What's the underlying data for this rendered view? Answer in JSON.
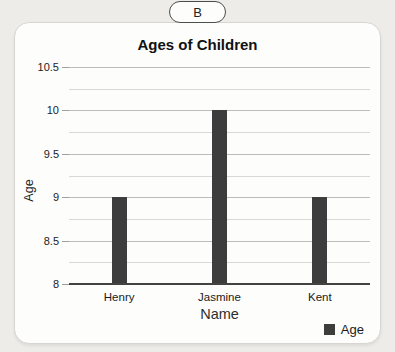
{
  "tab": {
    "label": "B"
  },
  "colors": {
    "bar": "#3d3d3d",
    "page_background": "#edece9",
    "card_background": "#fdfdfc",
    "gridline_major": "#bcbcbc",
    "gridline_minor": "#d8d8d8",
    "axis_baseline": "#434343"
  },
  "chart_data": {
    "type": "bar",
    "title": "Ages of Children",
    "xlabel": "Name",
    "ylabel": "Age",
    "categories": [
      "Henry",
      "Jasmine",
      "Kent"
    ],
    "series": [
      {
        "name": "Age",
        "values": [
          9,
          10,
          9
        ]
      }
    ],
    "ylim": [
      8,
      10.5
    ],
    "ytick_step": 0.5,
    "grid_step": 0.25,
    "grid": true,
    "legend_position": "bottom-right",
    "yticks": [
      "10.5",
      "10",
      "9.5",
      "9",
      "8.5",
      "8"
    ],
    "bar_color": "#3d3d3d"
  }
}
